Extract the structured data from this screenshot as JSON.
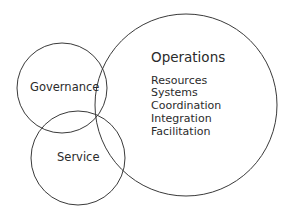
{
  "diagram": {
    "type": "venn",
    "background_color": "#ffffff",
    "stroke_color": "#3a3a3a",
    "text_color": "#2b2b2b",
    "circles": [
      {
        "id": "governance",
        "label": "Governance",
        "cx": 62,
        "cy": 88,
        "r": 45
      },
      {
        "id": "service",
        "label": "Service",
        "cx": 78,
        "cy": 158,
        "r": 47
      },
      {
        "id": "operations",
        "label": "Operations",
        "cx": 186,
        "cy": 105,
        "r": 91
      }
    ],
    "operations": {
      "title": "Operations",
      "items": [
        "Resources",
        "Systems",
        "Coordination",
        "Integration",
        "Facilitation"
      ]
    }
  }
}
